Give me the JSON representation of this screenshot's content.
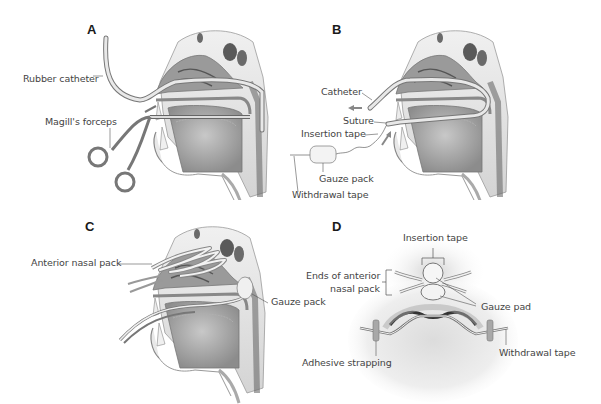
{
  "figure": {
    "type": "medical-illustration",
    "colors": {
      "tissue_dark": "#6e6e6e",
      "tissue_mid": "#a8a8a8",
      "tissue_light": "#d9d9d9",
      "bone": "#e6e6e6",
      "line": "#555555",
      "background": "#ffffff"
    }
  },
  "panels": [
    {
      "letter": "A",
      "labels": {
        "catheter": "Rubber catheter",
        "forceps": "Magill's forceps"
      }
    },
    {
      "letter": "B",
      "labels": {
        "catheter": "Catheter",
        "suture": "Suture",
        "insertion_tape": "Insertion tape",
        "gauze_pack": "Gauze pack",
        "withdrawal_tape": "Withdrawal tape"
      }
    },
    {
      "letter": "C",
      "labels": {
        "anterior_pack": "Anterior nasal pack",
        "gauze_pack": "Gauze pack"
      }
    },
    {
      "letter": "D",
      "labels": {
        "insertion_tape": "Insertion tape",
        "ends_line1": "Ends of anterior",
        "ends_line2": "nasal pack",
        "gauze_pad": "Gauze pad",
        "adhesive": "Adhesive strapping",
        "withdrawal_tape": "Withdrawal tape"
      }
    }
  ]
}
